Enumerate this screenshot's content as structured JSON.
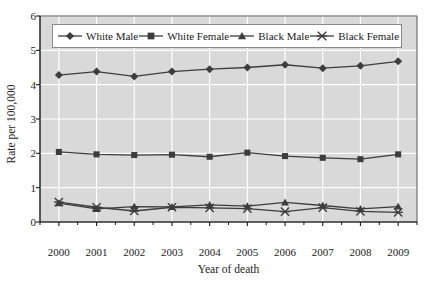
{
  "chart_data": {
    "type": "line",
    "title": "",
    "xlabel": "Year of death",
    "ylabel": "Rate per 100,000",
    "categories": [
      "2000",
      "2001",
      "2002",
      "2003",
      "2004",
      "2005",
      "2006",
      "2007",
      "2008",
      "2009"
    ],
    "x": [
      2000,
      2001,
      2002,
      2003,
      2004,
      2005,
      2006,
      2007,
      2008,
      2009
    ],
    "ylim": [
      0,
      6
    ],
    "yticks": [
      0,
      1,
      2,
      3,
      4,
      5,
      6
    ],
    "xlim": [
      2000,
      2009
    ],
    "grid": "both-white-on-gray",
    "legend_position": "top-inside",
    "plot_background": "#d9d9d9",
    "gridline_color": "#ffffff",
    "line_color": "#3d3d3d",
    "marker_color": "#3d3d3d",
    "series": [
      {
        "name": "White Male",
        "marker": "diamond",
        "values": [
          4.28,
          4.38,
          4.24,
          4.38,
          4.45,
          4.5,
          4.58,
          4.48,
          4.55,
          4.68
        ]
      },
      {
        "name": "White Female",
        "marker": "square",
        "values": [
          2.04,
          1.97,
          1.95,
          1.96,
          1.9,
          2.02,
          1.92,
          1.87,
          1.83,
          1.97
        ]
      },
      {
        "name": "Black Male",
        "marker": "triangle",
        "values": [
          0.55,
          0.38,
          0.45,
          0.44,
          0.5,
          0.46,
          0.57,
          0.48,
          0.38,
          0.45
        ]
      },
      {
        "name": "Black Female",
        "marker": "x-star",
        "values": [
          0.58,
          0.43,
          0.32,
          0.43,
          0.41,
          0.39,
          0.3,
          0.42,
          0.31,
          0.28
        ]
      }
    ]
  },
  "axis": {
    "ytick_labels": [
      "6",
      "5",
      "4",
      "3",
      "2",
      "1",
      "0"
    ],
    "xtick_labels": [
      "2000",
      "2001",
      "2002",
      "2003",
      "2004",
      "2005",
      "2006",
      "2007",
      "2008",
      "2009"
    ]
  },
  "legend": {
    "entries": [
      {
        "label": "White Male",
        "marker": "diamond"
      },
      {
        "label": "White Female",
        "marker": "square"
      },
      {
        "label": "Black Male",
        "marker": "triangle"
      },
      {
        "label": "Black Female",
        "marker": "x-star"
      }
    ]
  }
}
